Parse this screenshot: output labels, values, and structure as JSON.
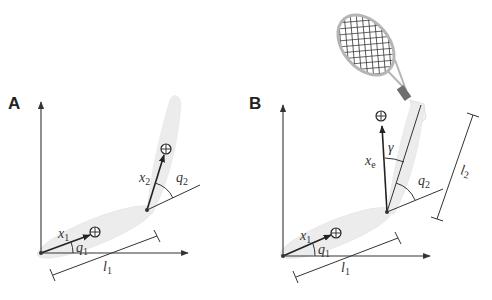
{
  "figure": {
    "panels": [
      {
        "id": "A",
        "label": "A",
        "labels": {
          "x1": "x",
          "x1_sub": "1",
          "q1": "q",
          "q1_sub": "1",
          "x2": "x",
          "x2_sub": "2",
          "q2": "q",
          "q2_sub": "2",
          "l1": "l",
          "l1_sub": "1"
        }
      },
      {
        "id": "B",
        "label": "B",
        "labels": {
          "x1": "x",
          "x1_sub": "1",
          "q1": "q",
          "q1_sub": "1",
          "xe": "x",
          "xe_sub": "e",
          "gamma": "γ",
          "q2": "q",
          "q2_sub": "2",
          "l1": "l",
          "l1_sub": "1",
          "l2": "l",
          "l2_sub": "2"
        },
        "extra": "tennis-racket"
      }
    ],
    "colors": {
      "segment_fill": "#ececec",
      "line": "#333333",
      "racket_frame": "#b5b5b5",
      "racket_grip": "#6f6f6f"
    }
  }
}
